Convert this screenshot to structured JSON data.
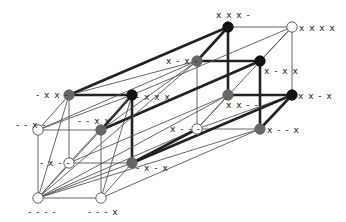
{
  "diagram": {
    "type": "4-dimensional hypercube lattice (two linked cubes)",
    "colors": {
      "white_node": "#ffffff",
      "gray_node": "#666666",
      "black_node": "#111111",
      "thin_edge": "#555555",
      "thick_edge": "#222222"
    },
    "nodes": [
      {
        "id": "0000",
        "label": "- - - -",
        "x": 38,
        "y": 198,
        "fill": "white",
        "lx": 28,
        "ly": 215,
        "anchor": "start"
      },
      {
        "id": "0001",
        "label": "- - - x",
        "x": 101,
        "y": 198,
        "fill": "white",
        "lx": 88,
        "ly": 215,
        "anchor": "start"
      },
      {
        "id": "0100",
        "label": "- x - -",
        "x": 69,
        "y": 163,
        "fill": "white",
        "lx": 40,
        "ly": 166,
        "anchor": "start"
      },
      {
        "id": "0101",
        "label": "- x - x",
        "x": 132,
        "y": 163,
        "fill": "gray",
        "lx": 136,
        "ly": 171,
        "anchor": "start"
      },
      {
        "id": "0010",
        "label": "- - x -",
        "x": 38,
        "y": 130,
        "fill": "white",
        "lx": 16,
        "ly": 128,
        "anchor": "start"
      },
      {
        "id": "0011",
        "label": "- - x x",
        "x": 101,
        "y": 130,
        "fill": "gray",
        "lx": 78,
        "ly": 124,
        "anchor": "start"
      },
      {
        "id": "0110",
        "label": "- x x -",
        "x": 69,
        "y": 95,
        "fill": "gray",
        "lx": 36,
        "ly": 98,
        "anchor": "start"
      },
      {
        "id": "0111",
        "label": "- x x x",
        "x": 132,
        "y": 95,
        "fill": "black",
        "lx": 136,
        "ly": 100,
        "anchor": "start"
      },
      {
        "id": "1000",
        "label": "x - - -",
        "x": 197,
        "y": 129,
        "fill": "white",
        "lx": 170,
        "ly": 132,
        "anchor": "start"
      },
      {
        "id": "1001",
        "label": "x - - x",
        "x": 260,
        "y": 129,
        "fill": "gray",
        "lx": 267,
        "ly": 133,
        "anchor": "start"
      },
      {
        "id": "1100",
        "label": "x x - -",
        "x": 228,
        "y": 95,
        "fill": "gray",
        "lx": 226,
        "ly": 108,
        "anchor": "start"
      },
      {
        "id": "1101",
        "label": "x x - x",
        "x": 292,
        "y": 95,
        "fill": "black",
        "lx": 298,
        "ly": 99,
        "anchor": "start"
      },
      {
        "id": "1010",
        "label": "x - x -",
        "x": 197,
        "y": 61,
        "fill": "gray",
        "lx": 166,
        "ly": 64,
        "anchor": "start"
      },
      {
        "id": "1011",
        "label": "x - x x",
        "x": 260,
        "y": 61,
        "fill": "black",
        "lx": 264,
        "ly": 74,
        "anchor": "start"
      },
      {
        "id": "1110",
        "label": "x x x -",
        "x": 228,
        "y": 27,
        "fill": "black",
        "lx": 216,
        "ly": 18,
        "anchor": "start"
      },
      {
        "id": "1111",
        "label": "x x x x",
        "x": 292,
        "y": 27,
        "fill": "white",
        "lx": 299,
        "ly": 31,
        "anchor": "start"
      }
    ],
    "edges": [
      {
        "a": "0000",
        "b": "0001",
        "w": "thin"
      },
      {
        "a": "0000",
        "b": "0100",
        "w": "thin"
      },
      {
        "a": "0000",
        "b": "0010",
        "w": "thin"
      },
      {
        "a": "0001",
        "b": "0101",
        "w": "thin"
      },
      {
        "a": "0001",
        "b": "0011",
        "w": "thin"
      },
      {
        "a": "0100",
        "b": "0101",
        "w": "thin"
      },
      {
        "a": "0100",
        "b": "0110",
        "w": "thin"
      },
      {
        "a": "0010",
        "b": "0011",
        "w": "thin"
      },
      {
        "a": "0010",
        "b": "0110",
        "w": "thin"
      },
      {
        "a": "0011",
        "b": "0111",
        "w": "thick"
      },
      {
        "a": "0101",
        "b": "0111",
        "w": "thick"
      },
      {
        "a": "0110",
        "b": "0111",
        "w": "thick"
      },
      {
        "a": "0000",
        "b": "0101",
        "w": "thin"
      },
      {
        "a": "0000",
        "b": "0011",
        "w": "thin"
      },
      {
        "a": "0000",
        "b": "0110",
        "w": "thin"
      },
      {
        "a": "0010",
        "b": "0111",
        "w": "thin"
      },
      {
        "a": "0100",
        "b": "0111",
        "w": "thin"
      },
      {
        "a": "0001",
        "b": "0111",
        "w": "thin"
      },
      {
        "a": "1000",
        "b": "1001",
        "w": "thin"
      },
      {
        "a": "1000",
        "b": "1100",
        "w": "thin"
      },
      {
        "a": "1000",
        "b": "1010",
        "w": "thin"
      },
      {
        "a": "1001",
        "b": "1101",
        "w": "thick"
      },
      {
        "a": "1001",
        "b": "1011",
        "w": "thick"
      },
      {
        "a": "1100",
        "b": "1101",
        "w": "thick"
      },
      {
        "a": "1100",
        "b": "1110",
        "w": "thick"
      },
      {
        "a": "1010",
        "b": "1011",
        "w": "thick"
      },
      {
        "a": "1010",
        "b": "1110",
        "w": "thick"
      },
      {
        "a": "1011",
        "b": "1111",
        "w": "thin"
      },
      {
        "a": "1101",
        "b": "1111",
        "w": "thin"
      },
      {
        "a": "1110",
        "b": "1111",
        "w": "thin"
      },
      {
        "a": "1000",
        "b": "1111",
        "w": "thin"
      },
      {
        "a": "1000",
        "b": "1101",
        "w": "thin"
      },
      {
        "a": "0000",
        "b": "1000",
        "w": "thin"
      },
      {
        "a": "0001",
        "b": "1001",
        "w": "thin"
      },
      {
        "a": "0100",
        "b": "1100",
        "w": "thin"
      },
      {
        "a": "0101",
        "b": "1101",
        "w": "thick"
      },
      {
        "a": "0010",
        "b": "1010",
        "w": "thin"
      },
      {
        "a": "0011",
        "b": "1011",
        "w": "thick"
      },
      {
        "a": "0110",
        "b": "1110",
        "w": "thick"
      },
      {
        "a": "0111",
        "b": "1111",
        "w": "thin"
      },
      {
        "a": "0000",
        "b": "1001",
        "w": "thin"
      },
      {
        "a": "0000",
        "b": "1100",
        "w": "thin"
      },
      {
        "a": "0000",
        "b": "1010",
        "w": "thin"
      },
      {
        "a": "0101",
        "b": "1000",
        "w": "thick"
      },
      {
        "a": "0011",
        "b": "1010",
        "w": "thin"
      },
      {
        "a": "0110",
        "b": "1010",
        "w": "thin"
      }
    ]
  }
}
